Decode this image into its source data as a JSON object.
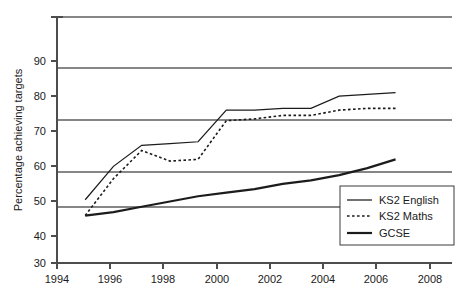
{
  "chart_data": {
    "type": "line",
    "title": "",
    "xlabel": "",
    "ylabel": "Percentage achieving targets",
    "xlim": [
      1994,
      2008
    ],
    "ylim": [
      30,
      100
    ],
    "xticks": [
      1994,
      1996,
      1998,
      2000,
      2002,
      2004,
      2006,
      2008
    ],
    "yticks": [
      30,
      40,
      50,
      60,
      70,
      80,
      90
    ],
    "grid": "horizontal",
    "legend_position": "bottom-right",
    "x": [
      1995,
      1996,
      1997,
      1998,
      1999,
      2000,
      2001,
      2002,
      2003,
      2004,
      2005,
      2006
    ],
    "series": [
      {
        "name": "KS2 English",
        "style": "solid-thin",
        "values": [
          48,
          57.5,
          63.5,
          64,
          64.5,
          73.5,
          73.5,
          74,
          74,
          77.5,
          78,
          78.5
        ]
      },
      {
        "name": "KS2 Maths",
        "style": "dotted",
        "values": [
          43.5,
          54,
          62,
          59,
          59.5,
          70.5,
          71,
          72,
          72,
          73.5,
          74,
          74
        ]
      },
      {
        "name": "GCSE",
        "style": "solid-thick",
        "values": [
          43.5,
          44.5,
          46,
          47.5,
          49,
          50,
          51,
          52.5,
          53.5,
          55,
          57,
          59.5
        ]
      }
    ]
  },
  "axis": {
    "ylabel": "Percentage achieving targets",
    "ytick_labels": [
      "90",
      "80",
      "70",
      "60",
      "50",
      "40",
      "30"
    ],
    "xtick_labels": [
      "1994",
      "1996",
      "1998",
      "2000",
      "2002",
      "2004",
      "2006",
      "2008"
    ]
  },
  "legend": {
    "entries": [
      {
        "label": "KS2 English",
        "swatch": "solid-thin-line-swatch"
      },
      {
        "label": "KS2 Maths",
        "swatch": "dotted-line-swatch"
      },
      {
        "label": "GCSE",
        "swatch": "solid-thick-line-swatch"
      }
    ]
  },
  "colors": {
    "line": "#1c1c1c",
    "grid": "#868686",
    "axis": "#4d4d4d",
    "text": "#1a1a1a",
    "background": "#ffffff"
  }
}
